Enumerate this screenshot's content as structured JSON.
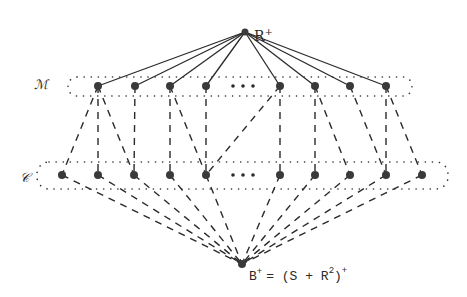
{
  "diagram": {
    "top_node": {
      "label": "R",
      "sup": "+",
      "x": 245,
      "y": 32
    },
    "bottom_node": {
      "label": "B",
      "sup": "+",
      "eq": "= (S + R",
      "sq": "2",
      "close": ")",
      "close_sup": "+",
      "x": 242,
      "y": 264
    },
    "layer_m": {
      "label": "ℳ",
      "node_xs": [
        98,
        135,
        170,
        206,
        280,
        315,
        350,
        386
      ],
      "ellipsis_x": 243,
      "y": 86
    },
    "layer_c": {
      "label": "𝒞",
      "node_xs": [
        62,
        98,
        134,
        170,
        206,
        280,
        315,
        350,
        386,
        422
      ],
      "ellipsis_x": 243,
      "y": 175
    },
    "m_to_c_edges": [
      [
        98,
        62
      ],
      [
        98,
        98
      ],
      [
        98,
        134
      ],
      [
        135,
        134
      ],
      [
        170,
        170
      ],
      [
        170,
        206
      ],
      [
        206,
        206
      ],
      [
        280,
        206
      ],
      [
        280,
        280
      ],
      [
        315,
        315
      ],
      [
        315,
        350
      ],
      [
        350,
        386
      ],
      [
        386,
        386
      ],
      [
        386,
        422
      ]
    ],
    "colors": {
      "ink": "#2a2a2a",
      "node": "#3a3a3a"
    }
  }
}
